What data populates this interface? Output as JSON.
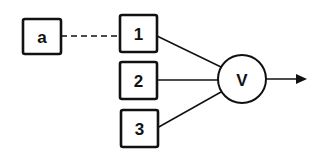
{
  "diagram": {
    "nodes": {
      "a": {
        "label": "a",
        "shape": "box"
      },
      "n1": {
        "label": "1",
        "shape": "box"
      },
      "n2": {
        "label": "2",
        "shape": "box"
      },
      "n3": {
        "label": "3",
        "shape": "box"
      },
      "v": {
        "label": "V",
        "shape": "circle"
      }
    },
    "edges": [
      {
        "from": "a",
        "to": "1",
        "style": "dashed"
      },
      {
        "from": "1",
        "to": "V",
        "style": "solid"
      },
      {
        "from": "2",
        "to": "V",
        "style": "solid"
      },
      {
        "from": "3",
        "to": "V",
        "style": "solid"
      },
      {
        "from": "V",
        "to": "output",
        "style": "arrow"
      }
    ],
    "colors": {
      "stroke": "#111111",
      "background": "#ffffff"
    }
  }
}
